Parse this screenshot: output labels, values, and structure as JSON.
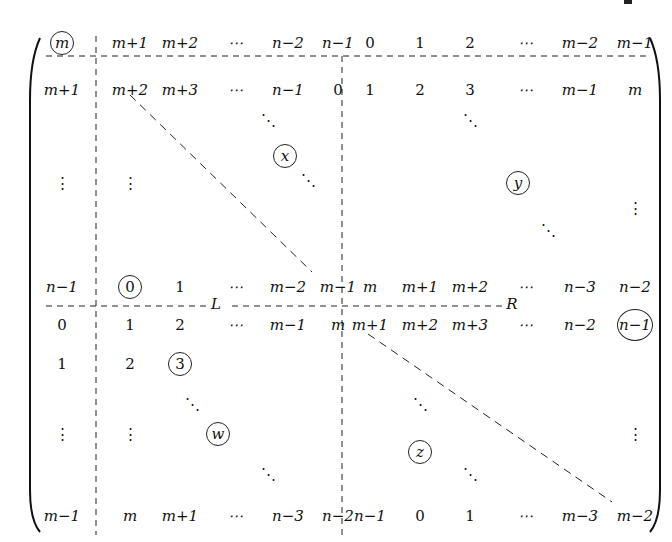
{
  "matrix": {
    "row0": [
      "m",
      "m+1",
      "m+2",
      "⋯",
      "n−2",
      "n−1",
      "0",
      "1",
      "2",
      "⋯",
      "m−2",
      "m−1"
    ],
    "row1": [
      "m+1",
      "m+2",
      "m+3",
      "⋯",
      "n−1",
      "0",
      "1",
      "2",
      "3",
      "⋯",
      "m−1",
      "m"
    ],
    "rowN1": [
      "n−1",
      "0",
      "1",
      "⋯",
      "m−2",
      "m−1",
      "m",
      "m+1",
      "m+2",
      "⋯",
      "n−3",
      "n−2"
    ],
    "rowA": [
      "0",
      "1",
      "2",
      "⋯",
      "m−1",
      "m",
      "m+1",
      "m+2",
      "m+3",
      "⋯",
      "n−2",
      "n−1"
    ],
    "rowB": [
      "1",
      "2",
      "3"
    ],
    "rowLast": [
      "m−1",
      "m",
      "m+1",
      "⋯",
      "n−3",
      "n−2",
      "n−1",
      "0",
      "1",
      "⋯",
      "m−3",
      "m−2"
    ],
    "labels": {
      "x": "x",
      "y": "y",
      "w": "w",
      "z": "z",
      "L": "L",
      "R": "R"
    },
    "vdots": "⋮",
    "ddots": "⋱"
  }
}
